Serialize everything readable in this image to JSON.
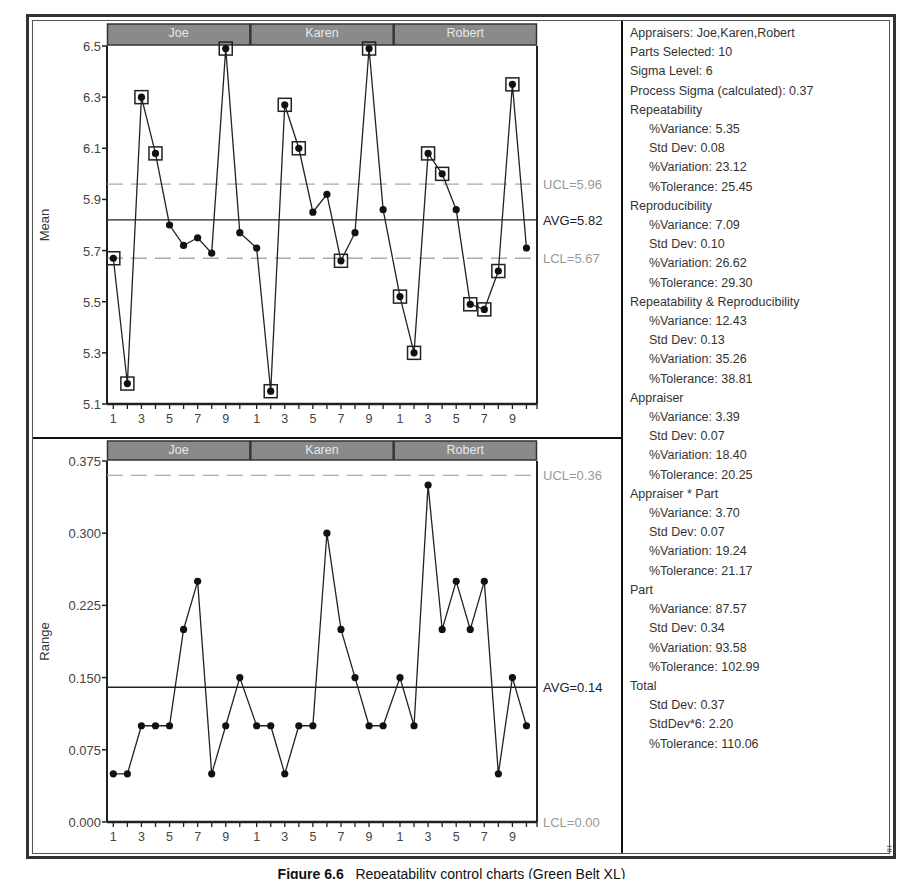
{
  "caption": {
    "label": "Figure 6.6",
    "text": "Repeatability control charts (Green Belt XL)"
  },
  "stats": {
    "appraisers": "Appraisers:  Joe,Karen,Robert",
    "parts_selected": "Parts Selected:  10",
    "sigma_level": "Sigma Level:  6",
    "process_sigma": "Process Sigma (calculated):  0.37",
    "sections": [
      {
        "title": "Repeatability",
        "lines": [
          "%Variance:  5.35",
          "Std Dev:  0.08",
          "%Variation:  23.12",
          "%Tolerance:  25.45"
        ]
      },
      {
        "title": "Reproducibility",
        "lines": [
          "%Variance:  7.09",
          "Std Dev:  0.10",
          "%Variation:  26.62",
          "%Tolerance:  29.30"
        ]
      },
      {
        "title": "Repeatability & Reproducibility",
        "lines": [
          "%Variance:  12.43",
          "Std Dev:  0.13",
          "%Variation:  35.26",
          "%Tolerance:  38.81"
        ]
      },
      {
        "title": "Appraiser",
        "lines": [
          "%Variance:  3.39",
          "Std Dev:  0.07",
          "%Variation:  18.40",
          "%Tolerance:  20.25"
        ]
      },
      {
        "title": "Appraiser * Part",
        "lines": [
          "%Variance:  3.70",
          "Std Dev:  0.07",
          "%Variation:  19.24",
          "%Tolerance:  21.17"
        ]
      },
      {
        "title": "Part",
        "lines": [
          "%Variance:  87.57",
          "Std Dev:  0.34",
          "%Variation:  93.58",
          "%Tolerance:  102.99"
        ]
      },
      {
        "title": "Total",
        "lines": [
          "Std Dev:  0.37",
          "StdDev*6:  2.20",
          "%Tolerance:  110.06"
        ]
      }
    ]
  },
  "chart_data": [
    {
      "type": "line",
      "title": "Mean chart",
      "xlabel": "",
      "ylabel": "Mean",
      "ylim": [
        5.1,
        6.5
      ],
      "yticks": [
        "6.5",
        "6.3",
        "6.1",
        "5.9",
        "5.7",
        "5.5",
        "5.3",
        "5.1"
      ],
      "xticks": [
        "1",
        "3",
        "5",
        "7",
        "9"
      ],
      "groups": [
        "Joe",
        "Karen",
        "Robert"
      ],
      "categories": [
        1,
        2,
        3,
        4,
        5,
        6,
        7,
        8,
        9,
        10
      ],
      "series": [
        {
          "name": "Joe",
          "values": [
            5.67,
            5.18,
            6.3,
            6.08,
            5.8,
            5.72,
            5.75,
            5.69,
            6.49,
            5.77
          ],
          "out_of_control": [
            1,
            2,
            3,
            4,
            9
          ]
        },
        {
          "name": "Karen",
          "values": [
            5.71,
            5.15,
            6.27,
            6.1,
            5.85,
            5.92,
            5.66,
            5.77,
            6.49,
            5.86
          ],
          "out_of_control": [
            2,
            3,
            4,
            7,
            9
          ]
        },
        {
          "name": "Robert",
          "values": [
            5.52,
            5.3,
            6.08,
            6.0,
            5.86,
            5.49,
            5.47,
            5.62,
            6.35,
            5.71
          ],
          "out_of_control": [
            1,
            2,
            3,
            4,
            6,
            7,
            8,
            9
          ]
        }
      ],
      "control_lines": {
        "ucl": {
          "value": 5.96,
          "label": "UCL=5.96"
        },
        "avg": {
          "value": 5.82,
          "label": "AVG=5.82"
        },
        "lcl": {
          "value": 5.67,
          "label": "LCL=5.67"
        }
      },
      "grid": false
    },
    {
      "type": "line",
      "title": "Range chart",
      "xlabel": "",
      "ylabel": "Range",
      "ylim": [
        0.0,
        0.375
      ],
      "yticks": [
        "0.375",
        "0.300",
        "0.225",
        "0.150",
        "0.075",
        "0.000"
      ],
      "xticks": [
        "1",
        "3",
        "5",
        "7",
        "9"
      ],
      "groups": [
        "Joe",
        "Karen",
        "Robert"
      ],
      "categories": [
        1,
        2,
        3,
        4,
        5,
        6,
        7,
        8,
        9,
        10
      ],
      "series": [
        {
          "name": "Joe",
          "values": [
            0.05,
            0.05,
            0.1,
            0.1,
            0.1,
            0.2,
            0.25,
            0.05,
            0.1,
            0.15
          ]
        },
        {
          "name": "Karen",
          "values": [
            0.1,
            0.1,
            0.05,
            0.1,
            0.1,
            0.3,
            0.2,
            0.15,
            0.1,
            0.1
          ]
        },
        {
          "name": "Robert",
          "values": [
            0.15,
            0.1,
            0.35,
            0.2,
            0.25,
            0.2,
            0.25,
            0.05,
            0.15,
            0.1
          ]
        }
      ],
      "control_lines": {
        "ucl": {
          "value": 0.36,
          "label": "UCL=0.36"
        },
        "avg": {
          "value": 0.14,
          "label": "AVG=0.14"
        },
        "lcl": {
          "value": 0.0,
          "label": "LCL=0.00"
        }
      },
      "grid": false
    }
  ],
  "colors": {
    "header_bar": "#8a8a8a",
    "header_text": "#e8e8e8",
    "limit_line": "#aaaaaa",
    "avg_line": "#222222",
    "point": "#111111",
    "limit_label": "#999999"
  }
}
